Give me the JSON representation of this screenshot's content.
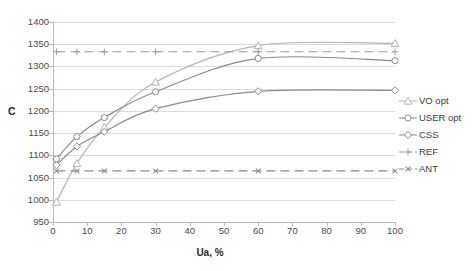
{
  "chart_data": {
    "type": "line",
    "title": "",
    "xlabel": "Ua, %",
    "ylabel": "C",
    "xlim": [
      0,
      100
    ],
    "ylim": [
      950,
      1400
    ],
    "xticks": [
      0,
      10,
      20,
      30,
      40,
      50,
      60,
      70,
      80,
      90,
      100
    ],
    "yticks": [
      950,
      1000,
      1050,
      1100,
      1150,
      1200,
      1250,
      1300,
      1350,
      1400
    ],
    "grid": true,
    "legend_position": "right",
    "x": [
      1,
      7,
      15,
      30,
      60,
      100
    ],
    "series": [
      {
        "name": "VO opt",
        "marker": "triangle",
        "linestyle": "solid",
        "color": "#b3b3b3",
        "values": [
          995,
          1082,
          1163,
          1265,
          1347,
          1352
        ]
      },
      {
        "name": "USER opt",
        "marker": "circle",
        "linestyle": "solid",
        "color": "#8a8a8a",
        "values": [
          1092,
          1142,
          1185,
          1243,
          1318,
          1313
        ]
      },
      {
        "name": "CSS",
        "marker": "diamond",
        "linestyle": "solid",
        "color": "#8a8a8a",
        "values": [
          1078,
          1120,
          1153,
          1205,
          1244,
          1246
        ]
      },
      {
        "name": "REF",
        "marker": "plus",
        "linestyle": "dashed",
        "color": "#9a9a9a",
        "values": [
          1333,
          1333,
          1333,
          1333,
          1333,
          1333
        ]
      },
      {
        "name": "ANT",
        "marker": "cross",
        "linestyle": "dashed",
        "color": "#8a8a8a",
        "values": [
          1065,
          1065,
          1065,
          1065,
          1065,
          1065
        ]
      }
    ]
  },
  "legend": {
    "items": [
      {
        "label": "VO opt"
      },
      {
        "label": "USER opt"
      },
      {
        "label": "CSS"
      },
      {
        "label": "REF"
      },
      {
        "label": "ANT"
      }
    ]
  },
  "axes": {
    "y_title": "C",
    "x_title": "Ua, %"
  }
}
